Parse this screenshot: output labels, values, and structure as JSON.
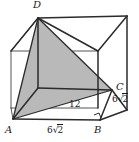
{
  "figure": {
    "canvas": {
      "width": 139,
      "height": 142
    },
    "style": {
      "background": "#ffffff",
      "edge_color": "#2b2b2b",
      "thin_edge_color": "#555555",
      "shade_fill": "#b9b9b9",
      "shade_stroke": "#2b2b2b",
      "text_color": "#1a1a1a"
    },
    "vertices": {
      "A": {
        "label": "A",
        "x": 13,
        "y": 119,
        "label_x": 6,
        "label_y": 124
      },
      "B": {
        "label": "B",
        "x": 100,
        "y": 120,
        "label_x": 95,
        "label_y": 125
      },
      "C": {
        "label": "C",
        "x": 112,
        "y": 90,
        "label_x": 116,
        "label_y": 83
      },
      "D": {
        "label": "D",
        "x": 38,
        "y": 18,
        "label_x": 34,
        "label_y": 2
      }
    },
    "measurements": [
      {
        "name": "edge-AB",
        "value": "6",
        "radical": "2",
        "x": 47,
        "y": 126
      },
      {
        "name": "diagonal-AC",
        "value": "12",
        "radical": "",
        "x": 69,
        "y": 100
      },
      {
        "name": "edge-BC",
        "value": "6",
        "radical": "2",
        "x": 113,
        "y": 95
      }
    ],
    "shaded_triangle": {
      "name": "triangle-ADC",
      "points": "13,119 38,18 112,90"
    },
    "right_angle_marker": {
      "name": "right-angle-at-B",
      "x": 96,
      "y": 112
    }
  }
}
